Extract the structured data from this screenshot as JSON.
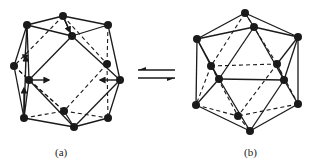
{
  "figure": {
    "labels": {
      "a": "(a)",
      "b": "(b)"
    },
    "equilibrium_arrow": "⇌",
    "colors": {
      "ink": "#1a1a1a",
      "background": "#ffffff"
    }
  },
  "structure_a": {
    "name": "cuboctahedron-like cluster",
    "nodes": {
      "A": [
        27,
        25
      ],
      "B": [
        63,
        16
      ],
      "C": [
        108,
        25
      ],
      "D": [
        72,
        36
      ],
      "E": [
        14,
        66
      ],
      "F": [
        107,
        64
      ],
      "G": [
        29,
        80
      ],
      "H": [
        120,
        80
      ],
      "I": [
        64,
        111
      ],
      "J": [
        24,
        118
      ],
      "K": [
        74,
        127
      ],
      "L": [
        108,
        118
      ]
    },
    "solid_edges": [
      [
        "A",
        "B"
      ],
      [
        "B",
        "C"
      ],
      [
        "A",
        "D"
      ],
      [
        "D",
        "C"
      ],
      [
        "B",
        "D"
      ],
      [
        "A",
        "E"
      ],
      [
        "A",
        "G"
      ],
      [
        "E",
        "J"
      ],
      [
        "G",
        "J"
      ],
      [
        "C",
        "H"
      ],
      [
        "H",
        "L"
      ],
      [
        "D",
        "G"
      ],
      [
        "D",
        "H"
      ],
      [
        "G",
        "K"
      ],
      [
        "H",
        "K"
      ],
      [
        "J",
        "K"
      ],
      [
        "K",
        "L"
      ],
      [
        "I",
        "K"
      ]
    ],
    "dashed_edges": [
      [
        "B",
        "E"
      ],
      [
        "B",
        "F"
      ],
      [
        "C",
        "F"
      ],
      [
        "F",
        "L"
      ],
      [
        "F",
        "I"
      ],
      [
        "E",
        "I"
      ],
      [
        "J",
        "I"
      ],
      [
        "I",
        "L"
      ],
      [
        "G",
        "I"
      ],
      [
        "E",
        "G"
      ]
    ],
    "arrows": [
      {
        "from": [
          29,
          80
        ],
        "to": [
          49,
          80
        ]
      },
      {
        "from": [
          120,
          80
        ],
        "to": [
          100,
          80
        ]
      },
      {
        "from": [
          24,
          118
        ],
        "to": [
          24,
          88
        ]
      },
      {
        "from": [
          24,
          118
        ],
        "to": [
          26,
          56
        ]
      },
      {
        "from": [
          63,
          16
        ],
        "to": [
          70,
          32
        ]
      },
      {
        "from": [
          27,
          25
        ],
        "to": [
          25,
          60
        ]
      }
    ]
  },
  "structure_b": {
    "name": "icosahedron cluster",
    "nodes": {
      "P1": [
        245,
        13
      ],
      "P2": [
        254,
        27
      ],
      "P3": [
        197,
        39
      ],
      "P4": [
        298,
        37
      ],
      "P5": [
        211,
        66
      ],
      "P6": [
        277,
        64
      ],
      "P7": [
        219,
        79
      ],
      "P8": [
        284,
        80
      ],
      "P9": [
        196,
        105
      ],
      "P10": [
        298,
        104
      ],
      "P11": [
        238,
        116
      ],
      "P12": [
        250,
        131
      ]
    },
    "solid_edges": [
      [
        "P1",
        "P3"
      ],
      [
        "P1",
        "P4"
      ],
      [
        "P1",
        "P2"
      ],
      [
        "P2",
        "P3"
      ],
      [
        "P2",
        "P4"
      ],
      [
        "P2",
        "P7"
      ],
      [
        "P2",
        "P8"
      ],
      [
        "P3",
        "P7"
      ],
      [
        "P4",
        "P8"
      ],
      [
        "P3",
        "P9"
      ],
      [
        "P4",
        "P10"
      ],
      [
        "P7",
        "P8"
      ],
      [
        "P7",
        "P9"
      ],
      [
        "P8",
        "P10"
      ],
      [
        "P7",
        "P12"
      ],
      [
        "P8",
        "P12"
      ],
      [
        "P9",
        "P12"
      ],
      [
        "P10",
        "P12"
      ],
      [
        "P3",
        "P5"
      ],
      [
        "P5",
        "P7"
      ],
      [
        "P6",
        "P8"
      ],
      [
        "P4",
        "P6"
      ]
    ],
    "dashed_edges": [
      [
        "P1",
        "P5"
      ],
      [
        "P1",
        "P6"
      ],
      [
        "P5",
        "P6"
      ],
      [
        "P5",
        "P9"
      ],
      [
        "P6",
        "P10"
      ],
      [
        "P5",
        "P11"
      ],
      [
        "P6",
        "P11"
      ],
      [
        "P9",
        "P11"
      ],
      [
        "P10",
        "P11"
      ],
      [
        "P11",
        "P12"
      ]
    ]
  }
}
